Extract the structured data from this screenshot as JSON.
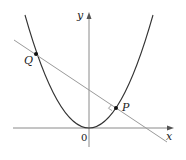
{
  "diagram": {
    "type": "coordinate-geometry",
    "axes": {
      "x_label": "x",
      "y_label": "y",
      "origin_label": "0"
    },
    "points": [
      {
        "name": "Q",
        "label": "Q"
      },
      {
        "name": "P",
        "label": "P"
      }
    ],
    "colors": {
      "curve": "#333333",
      "line": "#999999",
      "axes": "#888888",
      "points": "#111111"
    }
  }
}
